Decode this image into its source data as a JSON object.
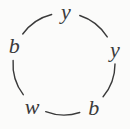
{
  "page": {
    "background": "#fbfbfa"
  },
  "diagram": {
    "type": "cycle",
    "sequence_clockwise_from_top": [
      "y",
      "y",
      "b",
      "w",
      "b"
    ],
    "ink_color": "#3a3a3a",
    "nodes": [
      {
        "label": "y",
        "angle_deg": 88
      },
      {
        "label": "y",
        "angle_deg": 16
      },
      {
        "label": "b",
        "angle_deg": -56
      },
      {
        "label": "w",
        "angle_deg": -127
      },
      {
        "label": "b",
        "angle_deg": 160
      }
    ],
    "geometry": {
      "center_x": 64,
      "center_y": 64,
      "arc_radius": 51,
      "label_radius": 53,
      "letter_gap_deg": 16,
      "stroke_width": 1.4,
      "font_size": 22
    }
  }
}
